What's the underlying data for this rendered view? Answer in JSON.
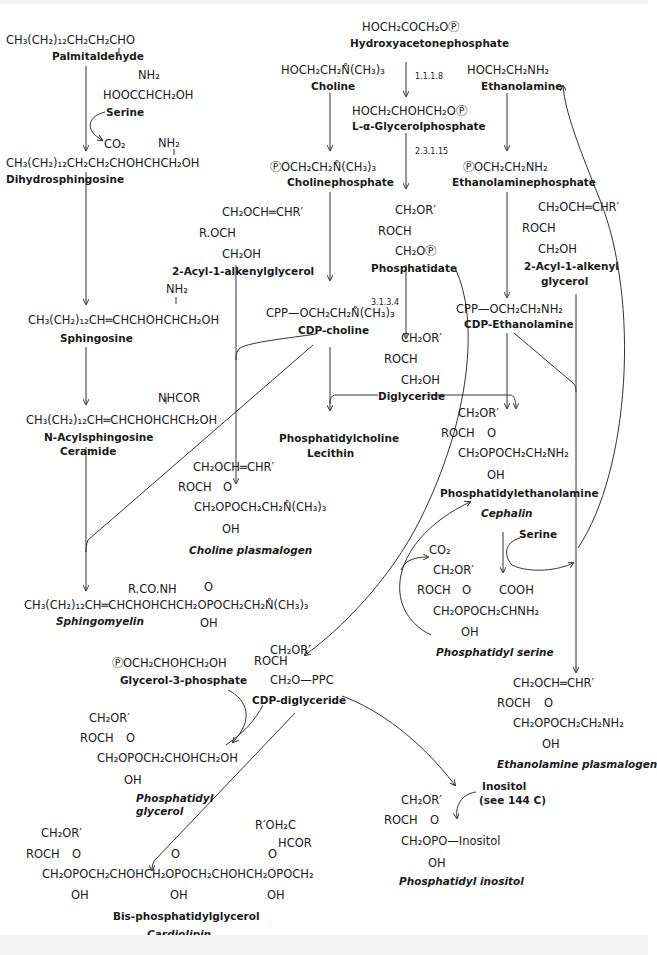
{
  "diagram": {
    "nodes": {
      "palmitaldehyde": {
        "formula": "CH₃(CH₂)₁₂CH₂CH₂CHO",
        "name": "Palmitaldehyde"
      },
      "serine_struct": {
        "formula_top": "NH₂",
        "formula": "HOOCCHCH₂OH"
      },
      "serine_label": "Serine",
      "co2_1": "CO₂",
      "dihydrosphingosine": {
        "formula_top": "NH₂",
        "formula": "CH₃(CH₂)₁₂CH₂CH₂CHOHCHCH₂OH",
        "name": "Dihydrosphingosine"
      },
      "sphingosine": {
        "formula_top": "NH₂",
        "formula": "CH₃(CH₂)₁₂CH═CHCHOHCHCH₂OH",
        "name": "Sphingosine"
      },
      "ceramide": {
        "formula_top": "NHCOR",
        "formula": "CH₃(CH₂)₁₂CH═CHCHOHCHCH₂OH",
        "name": "N-Acylsphingosine",
        "name2": "Ceramide"
      },
      "sphingomyelin": {
        "formula_top": "R.CO.NH",
        "o": "O",
        "formula": "CH₃(CH₂)₁₂CH═CHCHOHCHCH₂OPOCH₂CH₂N̊(CH₃)₃",
        "oh": "OH",
        "name": "Sphingomyelin"
      },
      "hydroxyacetonephosphate": {
        "formula": "HOCH₂COCH₂OⓅ",
        "name": "Hydroxyacetonephosphate"
      },
      "glycerolphosphate": {
        "formula": "HOCH₂CHOHCH₂OⓅ",
        "name": "L-α-Glycerolphosphate"
      },
      "choline": {
        "formula": "HOCH₂CH₂N̊(CH₃)₃",
        "name": "Choline"
      },
      "cholinephosphate": {
        "formula": "ⓅOCH₂CH₂N̊(CH₃)₃",
        "name": "Cholinephosphate"
      },
      "acylalkenylglycerol_1": {
        "l1": "CH₂OCH═CHR′",
        "l2": "R.OCH",
        "l3": "CH₂OH",
        "name": "2-Acyl-1-alkenylglycerol"
      },
      "phosphatidate": {
        "l1": "CH₂OR′",
        "l2": "ROCH",
        "l3": "CH₂OⓅ",
        "name": "Phosphatidate"
      },
      "cdp_choline": {
        "formula": "CPP—OCH₂CH₂N̊(CH₃)₃",
        "name": "CDP-choline"
      },
      "diglyceride": {
        "l1": "CH₂OR′",
        "l2": "ROCH",
        "l3": "CH₂OH",
        "name": "Diglyceride"
      },
      "lecithin": {
        "name": "Phosphatidylcholine",
        "name2": "Lecithin"
      },
      "choline_plasmalogen": {
        "l1": "CH₂OCH═CHR′",
        "l2": "ROCH",
        "o": "O",
        "l3": "CH₂OPOCH₂CH₂N̊(CH₃)₃",
        "oh": "OH",
        "name": "Choline plasmalogen"
      },
      "ethanolamine": {
        "formula": "HOCH₂CH₂NH₂",
        "name": "Ethanolamine"
      },
      "ethanolaminephosphate": {
        "formula": "ⓅOCH₂CH₂NH₂",
        "name": "Ethanolaminephosphate"
      },
      "acylalkenylglycerol_2": {
        "l1": "CH₂OCH═CHR′",
        "l2": "ROCH",
        "l3": "CH₂OH",
        "name": "2-Acyl-1-alkenyl",
        "name2": "glycerol"
      },
      "cdp_ethanolamine": {
        "formula": "CPP—OCH₂CH₂NH₂",
        "name": "CDP-Ethanolamine"
      },
      "cephalin": {
        "l1": "CH₂OR′",
        "l2": "ROCH",
        "o": "O",
        "l3": "CH₂OPOCH₂CH₂NH₂",
        "oh": "OH",
        "name": "Phosphatidylethanolamine",
        "name2": "Cephalin"
      },
      "serine_label_2": "Serine",
      "co2_2": "CO₂",
      "phosphatidyl_serine": {
        "l1": "CH₂OR′",
        "l2": "ROCH",
        "o": "O",
        "cooh": "COOH",
        "l3": "CH₂OPOCH₂CHNH₂",
        "oh": "OH",
        "name": "Phosphatidyl serine"
      },
      "ethanolamine_plasmalogen": {
        "l1": "CH₂OCH═CHR′",
        "l2": "ROCH",
        "o": "O",
        "l3": "CH₂OPOCH₂CH₂NH₂",
        "oh": "OH",
        "name": "Ethanolamine plasmalogen"
      },
      "cdp_diglyceride": {
        "l1": "CH₂OR′",
        "l2": "ROCH",
        "l3": "CH₂O—PPC",
        "name": "CDP-diglyceride"
      },
      "glycerol3phosphate": {
        "formula": "ⓅOCH₂CHOHCH₂OH",
        "name": "Glycerol-3-phosphate"
      },
      "phosphatidyl_glycerol": {
        "l1": "CH₂OR′",
        "l2": "ROCH",
        "o": "O",
        "l3": "CH₂OPOCH₂CHOHCH₂OH",
        "oh": "OH",
        "name": "Phosphatidyl",
        "name2": "glycerol"
      },
      "inositol_label": {
        "l1": "Inositol",
        "l2": "(see 144 C)"
      },
      "phosphatidyl_inositol": {
        "l1": "CH₂OR′",
        "l2": "ROCH",
        "o": "O",
        "l3": "CH₂OPO—Inositol",
        "oh": "OH",
        "name": "Phosphatidyl inositol"
      },
      "cardiolipin": {
        "l1": "CH₂OR′",
        "l2": "ROCH",
        "o1": "O",
        "o2": "O",
        "o3": "O",
        "r_top": "R′OH₂C",
        "r_mid": "HCOR",
        "l3": "CH₂OPOCH₂CHOHCH₂OPOCH₂CHOHCH₂OPOCH₂",
        "oh1": "OH",
        "oh2": "OH",
        "oh3": "OH",
        "name": "Bis-phosphatidylglycerol",
        "name2": "Cardiolipin"
      }
    },
    "enzymes": {
      "e1": "1.1.1.8",
      "e2": "2.3.1.15",
      "e3": "3.1.3.4"
    }
  }
}
